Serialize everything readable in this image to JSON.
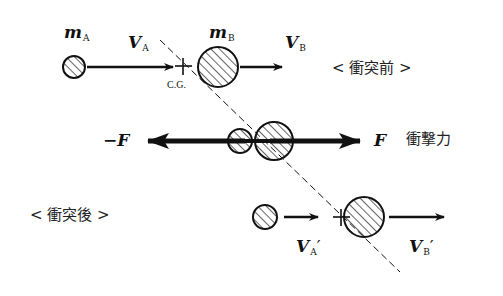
{
  "labels": {
    "mass_a": {
      "symbol": "m",
      "subscript": "A"
    },
    "mass_b": {
      "symbol": "m",
      "subscript": "B"
    },
    "velocity_a": {
      "symbol": "V",
      "subscript": "A"
    },
    "velocity_b": {
      "symbol": "V",
      "subscript": "B"
    },
    "velocity_a_after": {
      "symbol": "V",
      "subscript": "A",
      "prime": "′"
    },
    "velocity_b_after": {
      "symbol": "V",
      "subscript": "B",
      "prime": "′"
    },
    "center_of_gravity": "C.G.",
    "force_negative": "−F",
    "force_positive": "F",
    "impact_force": "衝撃力",
    "before_collision": "< 衝突前 >",
    "after_collision": "< 衝突後 >"
  },
  "colors": {
    "ink": "#111111",
    "background": "#ffffff"
  }
}
